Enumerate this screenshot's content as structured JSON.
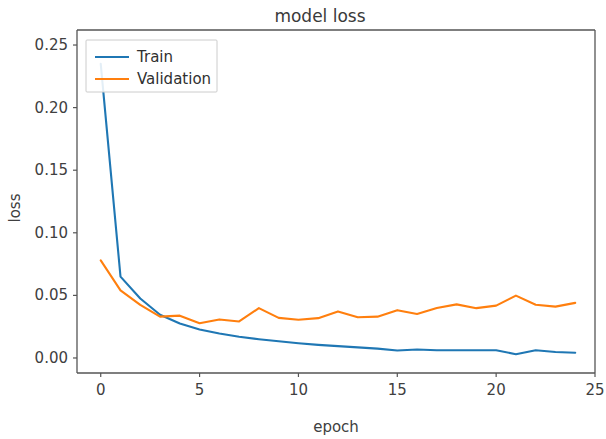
{
  "chart_data": {
    "type": "line",
    "title": "model loss",
    "xlabel": "epoch",
    "ylabel": "loss",
    "xlim": [
      -1.2,
      25
    ],
    "ylim": [
      -0.012,
      0.262
    ],
    "xticks": [
      0,
      5,
      10,
      15,
      20,
      25
    ],
    "xtick_labels": [
      "0",
      "5",
      "10",
      "15",
      "20",
      "25"
    ],
    "yticks": [
      0.0,
      0.05,
      0.1,
      0.15,
      0.2,
      0.25
    ],
    "ytick_labels": [
      "0.00",
      "0.05",
      "0.10",
      "0.15",
      "0.20",
      "0.25"
    ],
    "grid": false,
    "legend_position": "upper left",
    "x": [
      0,
      1,
      2,
      3,
      4,
      5,
      6,
      7,
      8,
      9,
      10,
      11,
      12,
      13,
      14,
      15,
      16,
      17,
      18,
      19,
      20,
      21,
      22,
      23,
      24
    ],
    "series": [
      {
        "name": "Train",
        "color": "#1f77b4",
        "values": [
          0.235,
          0.065,
          0.0475,
          0.0345,
          0.0275,
          0.0228,
          0.0195,
          0.017,
          0.015,
          0.0133,
          0.0118,
          0.0105,
          0.0095,
          0.0085,
          0.0075,
          0.006,
          0.0068,
          0.0062,
          0.0062,
          0.0062,
          0.0062,
          0.003,
          0.0062,
          0.0048,
          0.0042
        ]
      },
      {
        "name": "Validation",
        "color": "#ff7f0e",
        "values": [
          0.078,
          0.054,
          0.0425,
          0.033,
          0.0338,
          0.0278,
          0.0308,
          0.0292,
          0.0398,
          0.032,
          0.0305,
          0.0318,
          0.0372,
          0.0325,
          0.033,
          0.0382,
          0.0352,
          0.04,
          0.0428,
          0.0398,
          0.0418,
          0.0498,
          0.0425,
          0.041,
          0.044
        ]
      }
    ]
  },
  "legend": {
    "entries": [
      {
        "label": "Train"
      },
      {
        "label": "Validation"
      }
    ]
  },
  "colors": {
    "train": "#1f77b4",
    "validation": "#ff7f0e",
    "text": "#404040",
    "spine": "#555555",
    "background": "#ffffff"
  }
}
